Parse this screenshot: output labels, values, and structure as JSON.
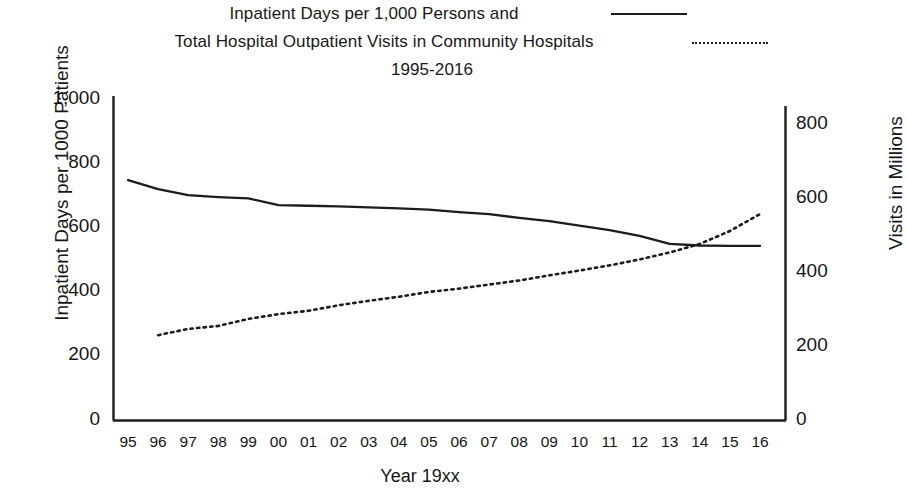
{
  "title": {
    "line1": "Inpatient Days per 1,000 Persons and",
    "line2": "Total Hospital Outpatient Visits in Community Hospitals",
    "line3": "1995-2016"
  },
  "legend": {
    "solid_name": "Inpatient Days per 1,000 Persons",
    "dotted_name": "Total Hospital Outpatient Visits in Community Hospitals",
    "solid_style": "solid-line-sample",
    "dotted_style": "dotted-line-sample"
  },
  "axes": {
    "y_left_title": "Inpatient Days per 1000 Patients",
    "y_right_title": "Visits in Millions",
    "x_title": "Year 19xx",
    "y_left_ticks": [
      "0",
      "200",
      "400",
      "600",
      "800",
      "1,000"
    ],
    "y_right_ticks": [
      "0",
      "200",
      "400",
      "600",
      "800"
    ],
    "x_ticks": [
      "95",
      "96",
      "97",
      "98",
      "99",
      "00",
      "01",
      "02",
      "03",
      "04",
      "05",
      "06",
      "07",
      "08",
      "09",
      "10",
      "11",
      "12",
      "13",
      "14",
      "15",
      "16"
    ]
  },
  "colors": {
    "line": "#1c1c1c",
    "axis": "#1c1c1c",
    "background": "#ffffff",
    "text": "#151515"
  },
  "chart_data": {
    "type": "line",
    "title": "Inpatient Days per 1,000 Persons and Total Hospital Outpatient Visits in Community Hospitals 1995-2016",
    "xlabel": "Year 19xx",
    "ylabel": "Inpatient Days per 1000 Patients",
    "y2label": "Visits in Millions",
    "ylim": [
      0,
      1000
    ],
    "y2lim": [
      0,
      900
    ],
    "grid": false,
    "legend_position": "top-right",
    "categories": [
      "95",
      "96",
      "97",
      "98",
      "99",
      "00",
      "01",
      "02",
      "03",
      "04",
      "05",
      "06",
      "07",
      "08",
      "09",
      "10",
      "11",
      "12",
      "13",
      "14",
      "15",
      "16"
    ],
    "series": [
      {
        "name": "Inpatient Days per 1,000 Persons",
        "axis": "left",
        "style": "solid",
        "units": "days per 1,000 persons",
        "values": [
          750,
          722,
          703,
          697,
          693,
          672,
          670,
          668,
          665,
          662,
          658,
          650,
          644,
          632,
          622,
          608,
          594,
          576,
          551,
          546,
          545,
          545
        ]
      },
      {
        "name": "Total Hospital Outpatient Visits in Community Hospitals",
        "axis": "right",
        "style": "dotted",
        "units": "millions of visits",
        "values": [
          null,
          231,
          248,
          256,
          275,
          288,
          297,
          312,
          324,
          335,
          348,
          357,
          368,
          379,
          393,
          406,
          420,
          436,
          455,
          478,
          513,
          559
        ]
      }
    ]
  }
}
